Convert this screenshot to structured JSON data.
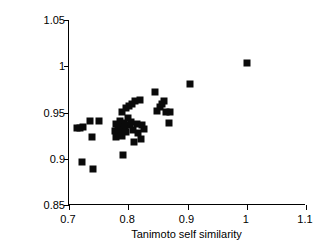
{
  "chart_data": {
    "type": "scatter",
    "title": "",
    "xlabel": "Tanimoto self similarity",
    "ylabel": "Stochastic Cosine self similarity",
    "xlim": [
      0.7,
      1.1
    ],
    "ylim": [
      0.85,
      1.05
    ],
    "xticks": [
      "0.7",
      "0.8",
      "0.9",
      "1",
      "1.1"
    ],
    "xtick_values": [
      0.7,
      0.8,
      0.9,
      1.0,
      1.1
    ],
    "yticks": [
      "0.85",
      "0.9",
      "0.95",
      "1",
      "1.05"
    ],
    "ytick_values": [
      0.85,
      0.9,
      0.95,
      1.0,
      1.05
    ],
    "grid": false,
    "legend": false,
    "marker": "filled-square",
    "marker_color": "#0a0a0a",
    "points": [
      {
        "x": 0.713,
        "y": 0.933
      },
      {
        "x": 0.719,
        "y": 0.933
      },
      {
        "x": 0.724,
        "y": 0.934
      },
      {
        "x": 0.722,
        "y": 0.897
      },
      {
        "x": 0.736,
        "y": 0.941
      },
      {
        "x": 0.738,
        "y": 0.924
      },
      {
        "x": 0.741,
        "y": 0.889
      },
      {
        "x": 0.75,
        "y": 0.941
      },
      {
        "x": 0.777,
        "y": 0.93
      },
      {
        "x": 0.779,
        "y": 0.938
      },
      {
        "x": 0.78,
        "y": 0.924
      },
      {
        "x": 0.782,
        "y": 0.934
      },
      {
        "x": 0.784,
        "y": 0.928
      },
      {
        "x": 0.786,
        "y": 0.941
      },
      {
        "x": 0.787,
        "y": 0.936
      },
      {
        "x": 0.788,
        "y": 0.931
      },
      {
        "x": 0.789,
        "y": 0.925
      },
      {
        "x": 0.79,
        "y": 0.951
      },
      {
        "x": 0.791,
        "y": 0.904
      },
      {
        "x": 0.793,
        "y": 0.939
      },
      {
        "x": 0.795,
        "y": 0.934
      },
      {
        "x": 0.796,
        "y": 0.955
      },
      {
        "x": 0.797,
        "y": 0.929
      },
      {
        "x": 0.799,
        "y": 0.944
      },
      {
        "x": 0.801,
        "y": 0.957
      },
      {
        "x": 0.803,
        "y": 0.936
      },
      {
        "x": 0.805,
        "y": 0.94
      },
      {
        "x": 0.806,
        "y": 0.959
      },
      {
        "x": 0.808,
        "y": 0.931
      },
      {
        "x": 0.81,
        "y": 0.918
      },
      {
        "x": 0.812,
        "y": 0.962
      },
      {
        "x": 0.814,
        "y": 0.938
      },
      {
        "x": 0.816,
        "y": 0.928
      },
      {
        "x": 0.819,
        "y": 0.964
      },
      {
        "x": 0.821,
        "y": 0.921
      },
      {
        "x": 0.823,
        "y": 0.936
      },
      {
        "x": 0.826,
        "y": 0.932
      },
      {
        "x": 0.845,
        "y": 0.972
      },
      {
        "x": 0.848,
        "y": 0.952
      },
      {
        "x": 0.853,
        "y": 0.956
      },
      {
        "x": 0.857,
        "y": 0.959
      },
      {
        "x": 0.861,
        "y": 0.962
      },
      {
        "x": 0.864,
        "y": 0.951
      },
      {
        "x": 0.868,
        "y": 0.939
      },
      {
        "x": 0.871,
        "y": 0.951
      },
      {
        "x": 0.905,
        "y": 0.981
      },
      {
        "x": 1.0,
        "y": 1.003
      }
    ]
  }
}
